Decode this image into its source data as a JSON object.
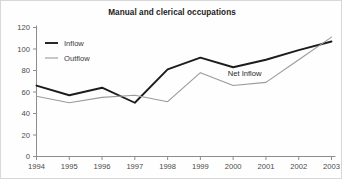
{
  "chart_data": {
    "type": "line",
    "title": "Manual and clerical occupations",
    "xlabel": "",
    "ylabel": "",
    "categories": [
      "1994",
      "1995",
      "1996",
      "1997",
      "1998",
      "1999",
      "2000",
      "2001",
      "2002",
      "2003"
    ],
    "x": [
      1994,
      1995,
      1996,
      1997,
      1998,
      1999,
      2000,
      2001,
      2002,
      2003
    ],
    "series": [
      {
        "name": "Inflow",
        "color": "#1c1c1c",
        "values": [
          66,
          57,
          64,
          50,
          81,
          92,
          83,
          90,
          99,
          107
        ]
      },
      {
        "name": "Outflow",
        "color": "#9a9a9a",
        "values": [
          56,
          50,
          55,
          57,
          51,
          78,
          66,
          69,
          90,
          111
        ]
      }
    ],
    "ylim": [
      0,
      120
    ],
    "yticks": [
      0,
      20,
      40,
      60,
      80,
      100,
      120
    ],
    "ytick_labels": [
      "0",
      "20",
      "40",
      "60",
      "80",
      "100",
      "120"
    ],
    "xtick_labels": [
      "1994",
      "1995",
      "1996",
      "1997",
      "1998",
      "1999",
      "2000",
      "2001",
      "2002",
      "2003"
    ],
    "grid": false,
    "legend_position": "top-left",
    "legend_entries": [
      "Inflow",
      "Outflow"
    ],
    "annotations": [
      {
        "text": "Net Inflow",
        "x": 2000.35,
        "y": 75
      }
    ]
  },
  "colors": {
    "background": "#fefefe",
    "axis": "#8d8d8d",
    "inflow": "#1c1c1c",
    "outflow": "#9a9a9a",
    "text": "#2a2a2a"
  }
}
